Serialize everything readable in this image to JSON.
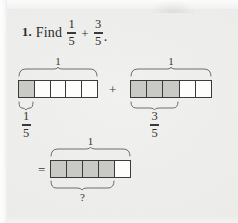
{
  "page": {
    "background_color": "#ececeb",
    "ink_color": "#2b2b2b"
  },
  "problem": {
    "number": "1.",
    "verb": "Find",
    "first_fraction": {
      "numerator": "1",
      "denominator": "5"
    },
    "operator": "+",
    "second_fraction": {
      "numerator": "3",
      "denominator": "5"
    },
    "terminator": "."
  },
  "operators": {
    "plus": "+",
    "equals": "="
  },
  "bar_models": [
    {
      "id": "addend-1",
      "whole_label": "1",
      "total_cells": 5,
      "shaded_cells": 1,
      "part_label": {
        "numerator": "1",
        "denominator": "5"
      }
    },
    {
      "id": "addend-2",
      "whole_label": "1",
      "total_cells": 5,
      "shaded_cells": 3,
      "part_label": {
        "numerator": "3",
        "denominator": "5"
      }
    },
    {
      "id": "sum",
      "whole_label": "1",
      "total_cells": 5,
      "shaded_cells": 4,
      "part_label": {
        "text": "?"
      }
    }
  ]
}
